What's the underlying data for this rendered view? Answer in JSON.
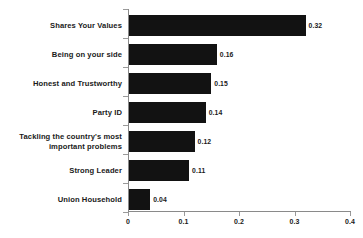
{
  "chart_data": {
    "type": "bar",
    "orientation": "horizontal",
    "title": "",
    "xlabel": "",
    "ylabel": "",
    "xlim": [
      0,
      0.4
    ],
    "xticks": [
      "0",
      "0.1",
      "0.2",
      "0.3",
      "0.4"
    ],
    "xtick_values": [
      0,
      0.1,
      0.2,
      0.3,
      0.4
    ],
    "grid": false,
    "legend": false,
    "bar_color": "#121212",
    "axis_color": "#8a8a8a",
    "background": "#ffffff",
    "categories": [
      "Shares Your Values",
      "Being on your side",
      "Honest and Trustworthy",
      "Party ID",
      "Tackling the country's most\nimportant problems",
      "Strong Leader",
      "Union Household"
    ],
    "values": [
      0.32,
      0.16,
      0.15,
      0.14,
      0.12,
      0.11,
      0.04
    ],
    "value_labels": [
      "0.32",
      "0.16",
      "0.15",
      "0.14",
      "0.12",
      "0.11",
      "0.04"
    ]
  }
}
